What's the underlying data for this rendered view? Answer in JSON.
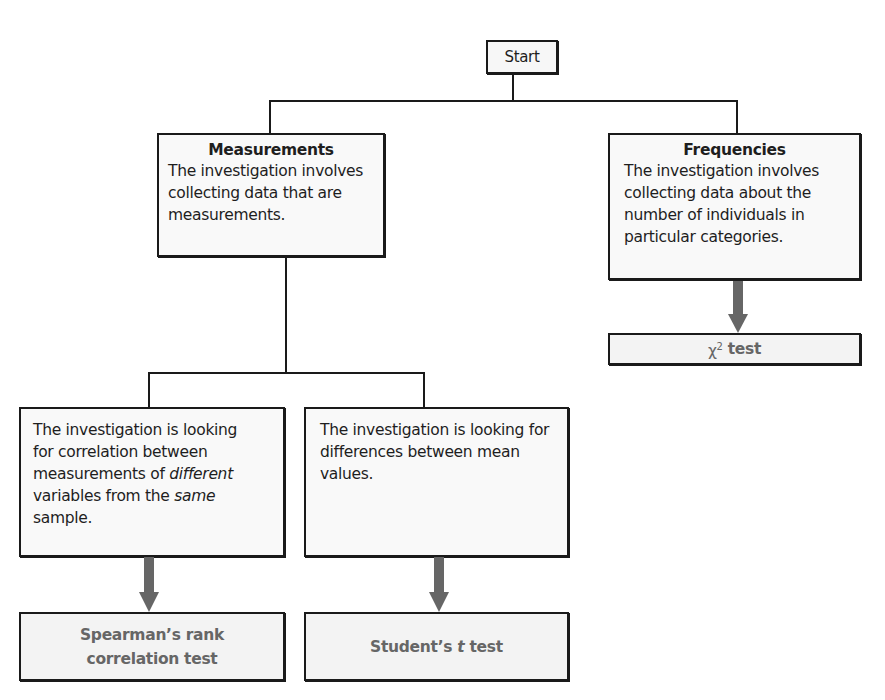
{
  "diagram": {
    "start": {
      "label": "Start"
    },
    "measurements": {
      "title": "Measurements",
      "description": "The investigation involves collecting data that are measurements."
    },
    "frequencies": {
      "title": "Frequencies",
      "description": "The investigation involves collecting data about the number of individuals in particular categories."
    },
    "correlation": {
      "line1": "The investigation is looking",
      "line2": "for correlation between",
      "line3_pre": "measurements of ",
      "line3_em": "different",
      "line4_em_pre": "variables from the ",
      "line4_em": "same",
      "line5": "sample."
    },
    "differences": {
      "description": "The investigation is looking for differences between mean values."
    },
    "results": {
      "spearman": "Spearman’s rank correlation test",
      "student_pre": "Student’s ",
      "student_t": "t",
      "student_post": " test",
      "chi_symbol": "χ",
      "chi_sup": "2",
      "chi_post": " test"
    },
    "colors": {
      "line": "#1a1a1a",
      "arrow": "#666666",
      "result_text": "#666666",
      "box_fill": "#f9f9f9"
    }
  }
}
